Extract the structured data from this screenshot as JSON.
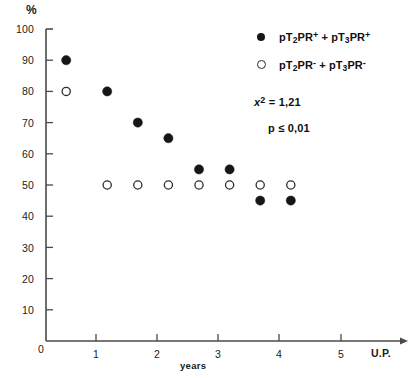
{
  "chart_data": {
    "type": "scatter",
    "title": "",
    "xlabel": "years",
    "ylabel": "%",
    "xlim": [
      0,
      5.6
    ],
    "ylim": [
      0,
      100
    ],
    "grid": false,
    "legend_position": "upper-right",
    "x_tick_labels": [
      "1",
      "2",
      "3",
      "4",
      "5"
    ],
    "x_tick_values": [
      1,
      2,
      3,
      4,
      5
    ],
    "x_axis_end_label": "U.P.",
    "y_tick_labels": [
      "0",
      "10",
      "20",
      "30",
      "40",
      "50",
      "60",
      "70",
      "80",
      "90",
      "100"
    ],
    "y_tick_values": [
      0,
      10,
      20,
      30,
      40,
      50,
      60,
      70,
      80,
      90,
      100
    ],
    "origin_label": "0",
    "series": [
      {
        "name": "pT2PR+ + pT3PR+",
        "marker": "filled-circle",
        "color": "#161616",
        "x": [
          0.33,
          1.0,
          1.5,
          2.0,
          2.5,
          3.0,
          3.5,
          4.0
        ],
        "values": [
          90,
          80,
          70,
          65,
          55,
          55,
          45,
          45
        ]
      },
      {
        "name": "pT2PR- + pT3PR-",
        "marker": "open-circle",
        "color": "#ffffff",
        "x": [
          0.33,
          1.0,
          1.5,
          2.0,
          2.5,
          3.0,
          3.5,
          4.0
        ],
        "values": [
          80,
          50,
          50,
          50,
          50,
          50,
          50,
          50
        ]
      }
    ],
    "annotations": [
      {
        "text": "x2 = 1,21"
      },
      {
        "text": "p ≤ 0,01"
      }
    ]
  },
  "axes": {
    "y_axis_unit": "%",
    "x_axis_title": "years",
    "x_axis_end": "U.P.",
    "origin": "0"
  },
  "legend": {
    "filled": {
      "prefix_a": "pT",
      "sub_a": "2",
      "mid_a": "PR",
      "sup_a": "+",
      "plus": "+",
      "prefix_b": "pT",
      "sub_b": "3",
      "mid_b": "PR",
      "sup_b": "+",
      "full_text": "pT2PR+ + pT3PR+"
    },
    "open": {
      "prefix_a": "pT",
      "sub_a": "2",
      "mid_a": "PR",
      "sup_a": "-",
      "plus": "+",
      "prefix_b": "pT",
      "sub_b": "3",
      "mid_b": "PR",
      "sup_b": "-",
      "full_text": "pT2PR- + pT3PR-"
    }
  },
  "stats": {
    "chi_symbol": "x",
    "chi_exponent": "2",
    "chi_equals": "= 1,21",
    "p_text": "p ≤ 0,01",
    "chi_full": "x2 = 1,21"
  },
  "ytick_labels": [
    "100",
    "90",
    "80",
    "70",
    "60",
    "50",
    "40",
    "30",
    "20",
    "10"
  ],
  "xtick_labels": [
    "1",
    "2",
    "3",
    "4",
    "5"
  ]
}
